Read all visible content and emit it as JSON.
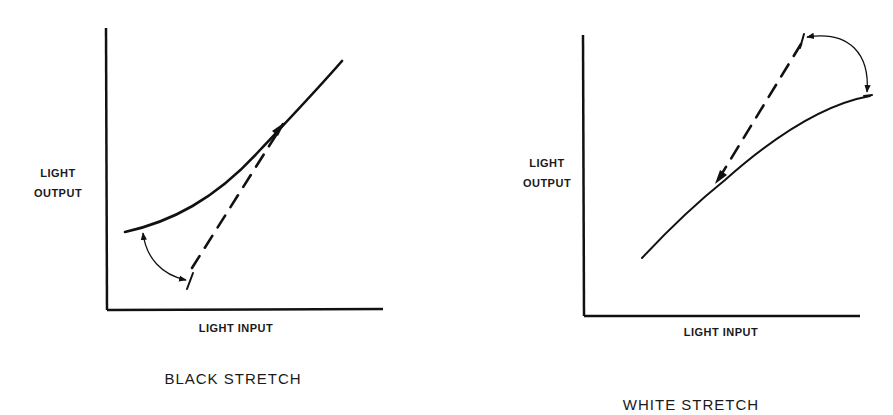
{
  "diagrams": [
    {
      "id": "black-stretch",
      "title": "BLACK STRETCH",
      "y_label_line1": "LIGHT",
      "y_label_line2": "OUTPUT",
      "x_label": "LIGHT INPUT",
      "curve": "solid transfer curve, concave up, lifted at the black end",
      "reference": "dashed linear reference line",
      "arrow": "curved arrow from dashed line start to solid curve start"
    },
    {
      "id": "white-stretch",
      "title": "WHITE STRETCH",
      "y_label_line1": "LIGHT",
      "y_label_line2": "OUTPUT",
      "x_label": "LIGHT INPUT",
      "curve": "solid transfer curve, concave down, compressed at the white end",
      "reference": "dashed linear reference line",
      "arrow": "curved arrow from dashed line end to solid curve end"
    }
  ],
  "colors": {
    "ink": "#111111",
    "background": "#ffffff"
  }
}
